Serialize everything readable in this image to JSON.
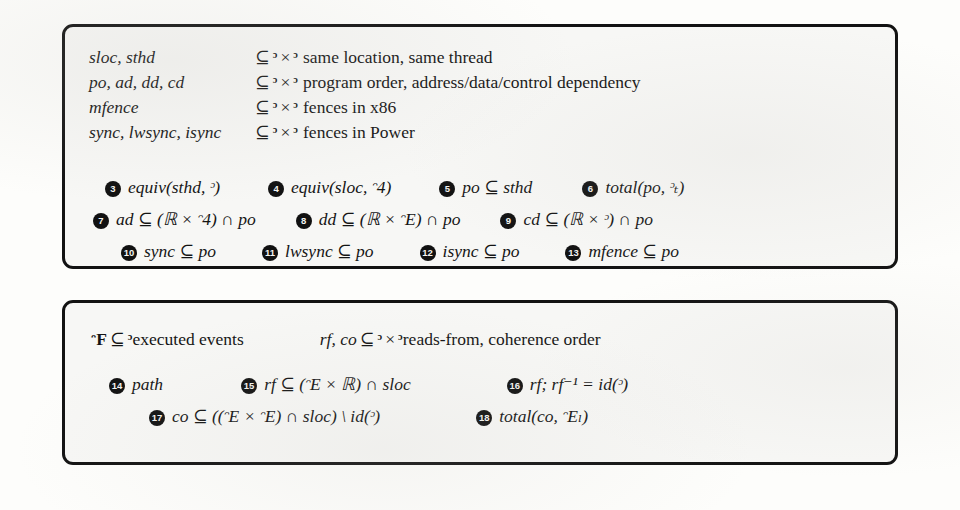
{
  "figure": {
    "kind": "axiom-box-diagram",
    "panels": [
      {
        "id": "relations",
        "name": "relation-declarations-panel",
        "declarations": [
          {
            "lhs": "sloc, sthd",
            "subset": "⊆",
            "domain_a": "ᵓ",
            "times": "×",
            "domain_b": "ᵓ",
            "description": "same location, same thread"
          },
          {
            "lhs": "po, ad, dd, cd",
            "subset": "⊆",
            "domain_a": "ᵓ",
            "times": "×",
            "domain_b": "ᵓ",
            "description": "program order, address/data/control dependency"
          },
          {
            "lhs": "mfence",
            "subset": "⊆",
            "domain_a": "ᵓ",
            "times": "×",
            "domain_b": "ᵓ",
            "description": "fences in x86"
          },
          {
            "lhs": "sync, lwsync, isync",
            "subset": "⊆",
            "domain_a": "ᵓ",
            "times": "×",
            "domain_b": "ᵓ",
            "description": "fences in Power"
          }
        ],
        "clause_rows": [
          [
            {
              "num": "3",
              "formula": "equiv(sthd, ᵓ)"
            },
            {
              "num": "4",
              "formula": "equiv(sloc, ᵔ4)"
            },
            {
              "num": "5",
              "formula": "po ⊆ sthd"
            },
            {
              "num": "6",
              "formula": "total(po, ᵓₜ)"
            }
          ],
          [
            {
              "num": "7",
              "formula": "ad ⊆ (ℝ × ᵔ4) ∩ po"
            },
            {
              "num": "8",
              "formula": "dd ⊆ (ℝ × ᵔE) ∩ po"
            },
            {
              "num": "9",
              "formula": "cd ⊆ (ℝ × ᵓ) ∩ po"
            }
          ],
          [
            {
              "num": "10",
              "formula": "sync ⊆ po"
            },
            {
              "num": "11",
              "formula": "lwsync ⊆ po"
            },
            {
              "num": "12",
              "formula": "isync ⊆ po"
            },
            {
              "num": "13",
              "formula": "mfence ⊆ po"
            }
          ]
        ]
      },
      {
        "id": "execution",
        "name": "execution-witness-panel",
        "header": {
          "executed": {
            "lhs": "ᵔF",
            "subset": "⊆",
            "domain": "ᵓ",
            "description": "executed events"
          },
          "relations": {
            "lhs": "rf, co",
            "subset": "⊆",
            "domain_a": "ᵓ",
            "times": "×",
            "domain_b": "ᵓ",
            "description": "reads-from, coherence order"
          }
        },
        "clause_rows": [
          [
            {
              "num": "14",
              "formula": "path"
            },
            {
              "num": "15",
              "formula": "rf ⊆ (ᵔE × ℝ) ∩ sloc"
            },
            {
              "num": "16",
              "formula": "rf; rf⁻¹ = id(ᵓ)"
            }
          ],
          [
            {
              "num": "17",
              "formula": "co ⊆ ((ᵔE × ᵔE) ∩ sloc) \\ id(ᵓ)"
            },
            {
              "num": "18",
              "formula": "total(co, ᵔEₗ)"
            }
          ]
        ]
      }
    ],
    "symbols": {
      "subset_eq": "⊆",
      "cartesian_product": "×",
      "intersection": "∩",
      "set_minus": "\\",
      "equals": "=",
      "semicolon": ";",
      "events": "ᵓ",
      "reads": "ℝ",
      "writes": "ᵔE",
      "memory_events": "ᵔ4",
      "executed": "ᵔF"
    },
    "colors": {
      "border": "#121212",
      "panel_background": "#f7f7f5",
      "page_background": "#fdfdfb",
      "badge_fill": "#111111",
      "badge_text": "#f4f4f2",
      "ink": "#141414"
    }
  }
}
